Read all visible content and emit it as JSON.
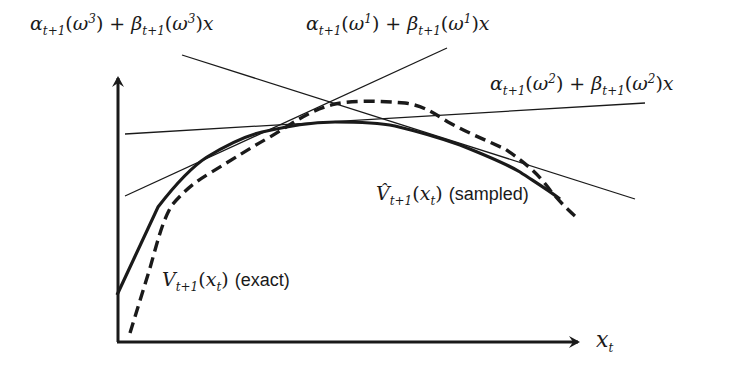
{
  "diagram": {
    "title": "",
    "labels": {
      "cut3": {
        "alpha": "α",
        "beta": "β",
        "sub": "t+1",
        "omega": "ω",
        "sup": "3",
        "tail": "x"
      },
      "cut1": {
        "alpha": "α",
        "beta": "β",
        "sub": "t+1",
        "omega": "ω",
        "sup": "1",
        "tail": "x"
      },
      "cut2": {
        "alpha": "α",
        "beta": "β",
        "sub": "t+1",
        "omega": "ω",
        "sup": "2",
        "tail": "x"
      },
      "sampled": {
        "symbol": "V̂",
        "sub": "t+1",
        "arg": "x",
        "argsub": "t",
        "note": "(sampled)"
      },
      "exact": {
        "symbol": "V",
        "sub": "t+1",
        "arg": "x",
        "argsub": "t",
        "note": "(exact)"
      },
      "xaxis": {
        "symbol": "x",
        "sub": "t"
      }
    },
    "curves": [
      {
        "name": "V_{t+1}(x_t) (exact)",
        "style": "dashed",
        "points": [
          [
            130,
            333
          ],
          [
            150,
            268
          ],
          [
            168,
            210
          ],
          [
            205,
            178
          ],
          [
            260,
            140
          ],
          [
            320,
            105
          ],
          [
            345,
            101
          ],
          [
            405,
            103
          ],
          [
            445,
            120
          ],
          [
            505,
            147
          ],
          [
            545,
            183
          ],
          [
            575,
            215
          ]
        ]
      },
      {
        "name": "V̂_{t+1}(x_t) (sampled)",
        "style": "solid-thick",
        "points": [
          [
            117,
            295
          ],
          [
            158,
            207
          ],
          [
            207,
            157
          ],
          [
            262,
            132
          ],
          [
            335,
            122
          ],
          [
            395,
            125
          ],
          [
            460,
            145
          ],
          [
            520,
            172
          ],
          [
            560,
            200
          ]
        ]
      }
    ],
    "cuts": [
      {
        "name": "α_{t+1}(ω^1) + β_{t+1}(ω^1)x",
        "from": [
          125,
          196
        ],
        "to": [
          447,
          48
        ]
      },
      {
        "name": "α_{t+1}(ω^2) + β_{t+1}(ω^2)x",
        "from": [
          125,
          134
        ],
        "to": [
          645,
          103
        ]
      },
      {
        "name": "α_{t+1}(ω^3) + β_{t+1}(ω^3)x",
        "from": [
          180,
          55
        ],
        "to": [
          635,
          200
        ]
      }
    ],
    "colors": {
      "ink": "#1a1a1a",
      "background": "#ffffff"
    }
  }
}
